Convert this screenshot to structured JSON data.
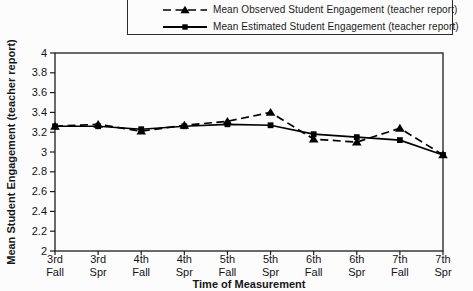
{
  "figure": {
    "background_color": "#fcfcfc"
  },
  "chart_data": {
    "type": "line",
    "title": "",
    "xlabel": "Time of Measurement",
    "ylabel": "Mean Student Engagement (teacher report)",
    "ylim": [
      2,
      4
    ],
    "ytick_step": 0.2,
    "grid": false,
    "legend_position": "top",
    "axis_color": "#1c1c1c",
    "text_color": "#141414",
    "categories": [
      "3rd Fall",
      "3rd Spr",
      "4th Fall",
      "4th Spr",
      "5th Fall",
      "5th Spr",
      "6th Fall",
      "6th Spr",
      "7th Fall",
      "7th Spr"
    ],
    "series": [
      {
        "name": "Mean Observed Student Engagement (teacher report)",
        "marker": "triangle",
        "line_style": "dashed",
        "color": "#000000",
        "values": [
          3.26,
          3.28,
          3.21,
          3.27,
          3.31,
          3.4,
          3.13,
          3.1,
          3.24,
          2.97
        ]
      },
      {
        "name": "Mean Estimated Student Engagement (teacher report)",
        "marker": "square",
        "line_style": "solid",
        "color": "#000000",
        "values": [
          3.26,
          3.26,
          3.23,
          3.26,
          3.28,
          3.27,
          3.18,
          3.15,
          3.12,
          2.97
        ]
      }
    ]
  }
}
